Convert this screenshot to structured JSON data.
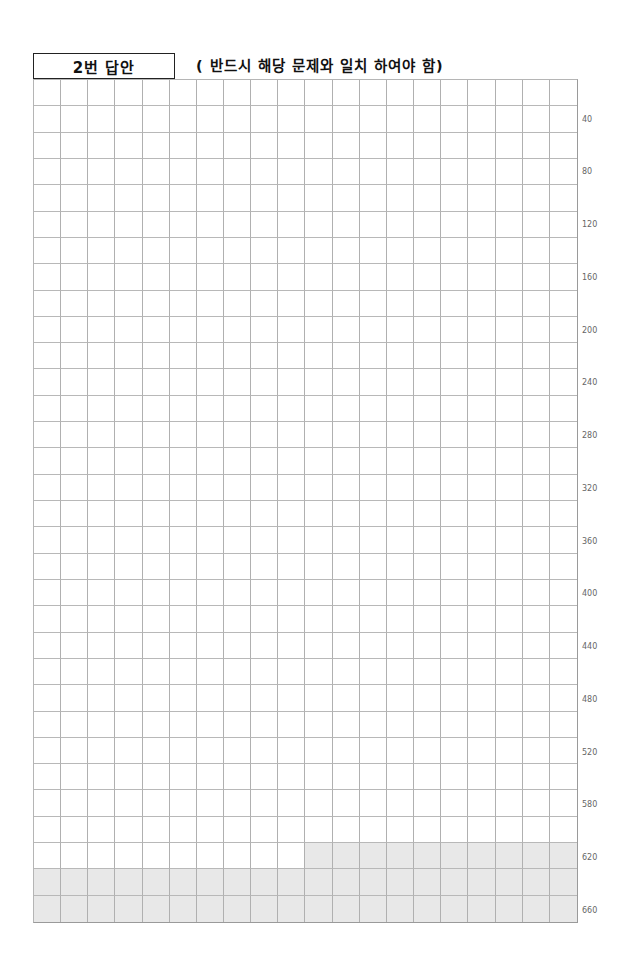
{
  "header": {
    "title": "2번 답안",
    "instruction": "( 반드시 해당 문제와 일치 하여야 함)"
  },
  "grid": {
    "columns": 20,
    "rows": 32,
    "shaded_from_row": 30,
    "shaded_from_col_in_first_row": 11,
    "shade_color": "#e8e8e8",
    "line_color": "#b0b0b0"
  },
  "row_labels": [
    {
      "row": 2,
      "text": "40"
    },
    {
      "row": 4,
      "text": "80"
    },
    {
      "row": 6,
      "text": "120"
    },
    {
      "row": 8,
      "text": "160"
    },
    {
      "row": 10,
      "text": "200"
    },
    {
      "row": 12,
      "text": "240"
    },
    {
      "row": 14,
      "text": "280"
    },
    {
      "row": 16,
      "text": "320"
    },
    {
      "row": 18,
      "text": "360"
    },
    {
      "row": 20,
      "text": "400"
    },
    {
      "row": 22,
      "text": "440"
    },
    {
      "row": 24,
      "text": "480"
    },
    {
      "row": 26,
      "text": "520"
    },
    {
      "row": 28,
      "text": "580"
    },
    {
      "row": 30,
      "text": "620"
    },
    {
      "row": 32,
      "text": "660"
    }
  ]
}
